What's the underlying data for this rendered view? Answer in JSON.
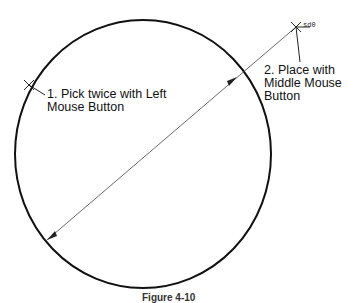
{
  "diagram": {
    "annotation_1": "1. Pick twice with Left\nMouse Button",
    "annotation_2": "2. Place with\nMiddle Mouse\nButton",
    "dimension_text": "sd0",
    "caption": "Figure 4-10",
    "colors": {
      "stroke": "#111111",
      "background": "#ffffff"
    }
  }
}
